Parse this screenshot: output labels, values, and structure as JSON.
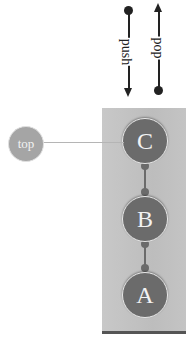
{
  "operations": {
    "push": {
      "label": "push",
      "direction": "down"
    },
    "pop": {
      "label": "pop",
      "direction": "up"
    }
  },
  "pointer": {
    "label": "top"
  },
  "stack": {
    "items": [
      {
        "label": "C",
        "position": "top"
      },
      {
        "label": "B",
        "position": "middle"
      },
      {
        "label": "A",
        "position": "bottom"
      }
    ]
  },
  "colors": {
    "node_fill": "#6b6b6b",
    "container_fill": "#c4c4c4",
    "pointer_fill": "#a5a5a5",
    "line": "#222222"
  }
}
